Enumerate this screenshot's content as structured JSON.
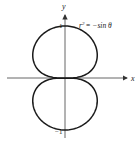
{
  "chart_data": {
    "type": "line",
    "subtype": "polar-curve",
    "title": "",
    "equation": "r² = −sin θ",
    "equation_parts": {
      "lhs": "r",
      "exp": "2",
      "rhs": "= −sin θ"
    },
    "xlabel": "x",
    "ylabel": "y",
    "tick_labels": {
      "y_top": "1",
      "y_bottom": "−1"
    },
    "xlim": [
      -1.15,
      1.2
    ],
    "ylim": [
      -1.15,
      1.25
    ],
    "grid": false,
    "legend": null,
    "series": [
      {
        "name": "r² = −sin θ (lemniscate-like figure-eight)",
        "description": "Two closed lobes touching at origin, upper lobe reaching y=1, lower lobe reaching y=−1"
      }
    ]
  },
  "colors": {
    "curve": "#1a1a1a",
    "axis": "#555555",
    "background": "#ffffff"
  }
}
